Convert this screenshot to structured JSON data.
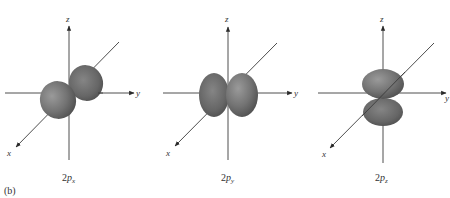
{
  "figure": {
    "panel_label": "(b)",
    "colors": {
      "lobe_light": "#8a8a8a",
      "lobe_mid": "#6e6e6e",
      "lobe_dark": "#4a4a4a",
      "axis": "#3a3a3a",
      "background": "#ffffff"
    },
    "panels": [
      {
        "id": "2px",
        "caption_main": "2",
        "caption_italic": "p",
        "caption_sub": "x",
        "orientation": "lobes along x-axis (diagonal)",
        "axes": {
          "x": "x",
          "y": "y",
          "z": "z"
        }
      },
      {
        "id": "2py",
        "caption_main": "2",
        "caption_italic": "p",
        "caption_sub": "y",
        "orientation": "lobes along y-axis (horizontal)",
        "axes": {
          "x": "x",
          "y": "y",
          "z": "z"
        }
      },
      {
        "id": "2pz",
        "caption_main": "2",
        "caption_italic": "p",
        "caption_sub": "z",
        "orientation": "lobes along z-axis (vertical)",
        "axes": {
          "x": "x",
          "y": "y",
          "z": "z"
        }
      }
    ]
  }
}
